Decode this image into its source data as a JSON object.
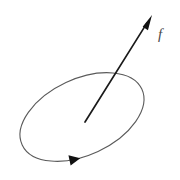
{
  "figure": {
    "canvas": {
      "width": 180,
      "height": 180,
      "background": "#ffffff"
    },
    "colors": {
      "loop_stroke": "#5a5a5a",
      "vector_stroke": "#1a1a1a",
      "arrowhead_fill": "#111111",
      "label_color": "#4a4a4a",
      "background": "#ffffff"
    },
    "loop": {
      "shape": "ellipse",
      "center_x": 82,
      "center_y": 117,
      "radius_x": 66,
      "radius_y": 38,
      "rotation_deg": -25,
      "stroke_width": 1.1,
      "orientation": "counterclockwise",
      "direction_marker_label": "circulation-direction-arrowhead"
    },
    "vector": {
      "tail_x": 85,
      "tail_y": 122,
      "tip_x": 152,
      "tip_y": 15,
      "stroke_width": 1.7,
      "arrowhead_length": 15,
      "arrowhead_half_width": 4.6,
      "label": "f",
      "label_x": 158,
      "label_y": 27
    }
  }
}
